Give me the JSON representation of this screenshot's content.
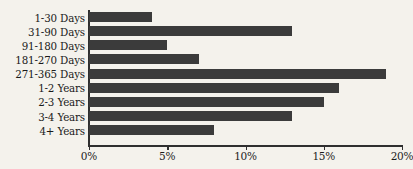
{
  "chart_data": {
    "type": "bar",
    "orientation": "horizontal",
    "title": "",
    "xlabel": "",
    "ylabel": "",
    "categories": [
      "1-30 Days",
      "31-90 Days",
      "91-180 Days",
      "181-270 Days",
      "271-365 Days",
      "1-2 Years",
      "2-3 Years",
      "3-4 Years",
      "4+ Years"
    ],
    "values": [
      4,
      13,
      5,
      7,
      19,
      16,
      15,
      13,
      8
    ],
    "value_unit": "%",
    "xlim": [
      0,
      20
    ],
    "xticks": [
      0,
      5,
      10,
      15,
      20
    ],
    "xtick_labels": [
      "0%",
      "5%",
      "10%",
      "15%",
      "20%"
    ],
    "grid": false,
    "legend": false,
    "bar_color": "#3b3b3b",
    "background_color": "#f4f2ec",
    "axis_color": "#2f2f2f"
  }
}
